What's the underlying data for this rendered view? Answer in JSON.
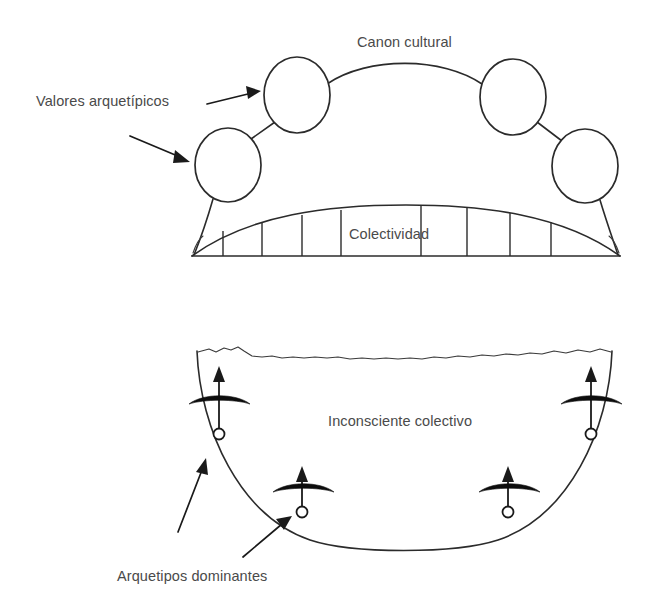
{
  "figure": {
    "name": "collective-unconscious-diagram",
    "background_color": "#ffffff",
    "ink_color": "#2b2b2b",
    "text_color": "#4a4a4a"
  },
  "upper_panel": {
    "name": "cultural-canon-panel",
    "labels": {
      "canon": "Canon cultural",
      "archetypal_values": "Valores arquetípicos",
      "collectivity": "Colectividad"
    },
    "nodes": [
      {
        "id": "node-left-low",
        "cx": 228,
        "cy": 165,
        "rx": 33,
        "ry": 37
      },
      {
        "id": "node-left-high",
        "cx": 297,
        "cy": 95,
        "rx": 33,
        "ry": 38
      },
      {
        "id": "node-right-high",
        "cx": 513,
        "cy": 97,
        "rx": 33,
        "ry": 38
      },
      {
        "id": "node-right-low",
        "cx": 585,
        "cy": 166,
        "rx": 33,
        "ry": 37
      }
    ],
    "connectors": [
      {
        "id": "connector-left",
        "from": "node-left-low",
        "to": "node-left-high"
      },
      {
        "id": "connector-arc",
        "from": "node-left-high",
        "to": "node-right-high"
      },
      {
        "id": "connector-right",
        "from": "node-right-high",
        "to": "node-right-low"
      },
      {
        "id": "stem-left",
        "from": "node-left-low",
        "to": "collectivity-band"
      },
      {
        "id": "stem-right",
        "from": "node-right-low",
        "to": "collectivity-band"
      }
    ],
    "collectivity_band": {
      "baseline_y": 256,
      "left_x": 192,
      "right_x": 620,
      "crown_y": 206,
      "divider_count": 8,
      "divider_x": [
        223,
        262,
        302,
        341,
        421,
        467,
        510,
        551
      ]
    },
    "pointers": [
      {
        "id": "pointer-values-upper",
        "x1": 207,
        "y1": 104,
        "x2": 259,
        "y2": 92
      },
      {
        "id": "pointer-values-lower",
        "x1": 130,
        "y1": 136,
        "x2": 188,
        "y2": 161
      }
    ]
  },
  "lower_panel": {
    "name": "collective-unconscious-panel",
    "labels": {
      "unconscious": "Inconsciente colectivo",
      "dominant_archetypes": "Arquetipos dominantes"
    },
    "bowl": {
      "left_rim_x": 197,
      "right_rim_x": 612,
      "rim_y": 351,
      "bottom_y": 545,
      "surface_line": "wavy"
    },
    "archetypes": [
      {
        "id": "archetype-outer-left",
        "cx": 219,
        "cy": 434,
        "arrow_top_y": 370
      },
      {
        "id": "archetype-inner-left",
        "cx": 302,
        "cy": 512,
        "arrow_top_y": 470
      },
      {
        "id": "archetype-inner-right",
        "cx": 508,
        "cy": 512,
        "arrow_top_y": 470
      },
      {
        "id": "archetype-outer-right",
        "cx": 591,
        "cy": 434,
        "arrow_top_y": 370
      }
    ],
    "pointers": [
      {
        "id": "pointer-archetypes-upper",
        "x1": 178,
        "y1": 532,
        "x2": 204,
        "y2": 460
      },
      {
        "id": "pointer-archetypes-lower",
        "x1": 243,
        "y1": 557,
        "x2": 288,
        "y2": 520
      }
    ]
  }
}
